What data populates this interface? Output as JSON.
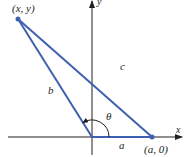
{
  "diagram": {
    "type": "triangle-law-of-cosines",
    "colors": {
      "triangle": "#3f5fb0",
      "axes": "#231f20",
      "background": "#ffffff"
    },
    "axes": {
      "x_label": "x",
      "y_label": "y"
    },
    "points": {
      "vertex_label": "(x, y)",
      "a_point_label": "(a, 0)"
    },
    "sides": {
      "a": "a",
      "b": "b",
      "c": "c"
    },
    "angle": {
      "label": "θ"
    }
  }
}
